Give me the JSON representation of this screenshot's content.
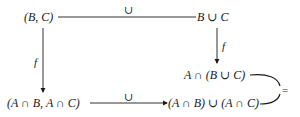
{
  "diagram": {
    "type": "commutative-diagram",
    "nodes": {
      "top_left": "(B, C)",
      "top_right": "B ∪ C",
      "middle_right": "A ∩ (B ∪ C)",
      "bottom_left": "(A ∩ B, A ∩ C)",
      "bottom_right": "(A ∩ B) ∪ (A ∩ C)"
    },
    "edges": {
      "top": {
        "from": "top_left",
        "to": "top_right",
        "label": "∪"
      },
      "left": {
        "from": "top_left",
        "to": "bottom_left",
        "label": "f"
      },
      "right": {
        "from": "top_right",
        "to": "middle_right",
        "label": "f"
      },
      "bottom": {
        "from": "bottom_left",
        "to": "bottom_right",
        "label": "∪"
      },
      "equality": {
        "from": "middle_right",
        "to": "bottom_right",
        "label": "="
      }
    },
    "colors": {
      "ink": "#1a1a1a",
      "background": "#ffffff"
    }
  }
}
